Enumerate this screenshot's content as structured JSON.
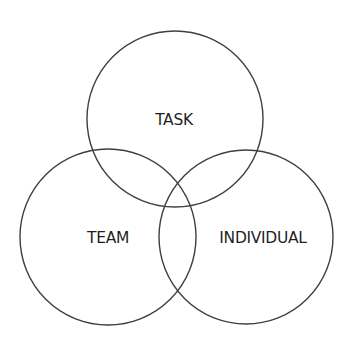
{
  "diagram": {
    "type": "venn",
    "background": "#ffffff",
    "stroke_color": "#3f3f3f",
    "text_color": "#1f1f1f",
    "circles": [
      {
        "id": "task",
        "label": "TASK",
        "cx": 175,
        "cy": 119,
        "r": 88,
        "label_x": 174,
        "label_y": 125
      },
      {
        "id": "team",
        "label": "TEAM",
        "cx": 108,
        "cy": 237,
        "r": 88,
        "label_x": 108,
        "label_y": 243
      },
      {
        "id": "individual",
        "label": "INDIVIDUAL",
        "cx": 246,
        "cy": 237,
        "r": 87,
        "label_x": 263,
        "label_y": 243
      }
    ]
  }
}
